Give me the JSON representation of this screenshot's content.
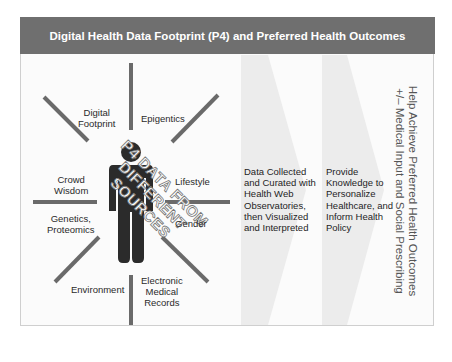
{
  "header": {
    "title": "Digital Health Data Footprint (P4) and Preferred Health Outcomes"
  },
  "colors": {
    "header_bg": "#6f6f6f",
    "spoke": "#6a6a6a",
    "figure": "#2b2b2b",
    "chevron": "#ececec"
  },
  "sources": {
    "digital_footprint": "Digital\nFootprint",
    "epigenetics": "Epigentics",
    "crowd_wisdom": "Crowd\nWisdom",
    "lifestyle": "Lifestyle",
    "genetics": "Genetics,\nProteomics",
    "gender": "Gender",
    "environment": "Environment",
    "emr": "Electronic\nMedical\nRecords"
  },
  "watermark": "P4 DATA FROM\nDIFFERENT\nSOURCES",
  "steps": [
    {
      "text": "Data Collected\nand Curated with\nHealth Web\nObservatories,\nthen Visualized\nand Interpreted"
    },
    {
      "text": "Provide\nKnowledge to\nPersonalize\nHealthcare, and\nInform Health\nPolicy"
    }
  ],
  "outcome": {
    "line1": "Help Achieve Preferred Health Outcomes",
    "line2": "+/– Medical Input and Social Prescribing"
  }
}
